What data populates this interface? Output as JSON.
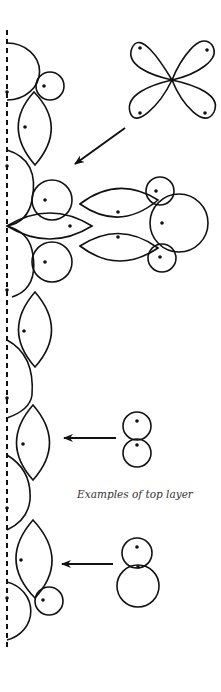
{
  "caption": "Examples of top layer",
  "colors": {
    "ink": "#111111",
    "background": "#ffffff"
  },
  "figure": {
    "type": "diagram",
    "axis": {
      "style": "dashed",
      "orientation": "vertical"
    },
    "insets": [
      "four-petal-flower",
      "figure-eight",
      "snowman"
    ]
  }
}
